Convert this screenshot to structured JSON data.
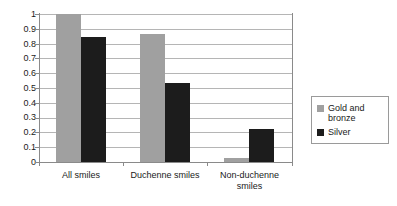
{
  "chart_data": {
    "type": "bar",
    "title": "",
    "xlabel": "",
    "ylabel": "",
    "categories": [
      "All smiles",
      "Duchenne smiles",
      "Non-duchenne smiles"
    ],
    "series": [
      {
        "name": "Gold and bronze",
        "color": "#a0a0a0",
        "values": [
          1.0,
          0.865,
          0.025
        ]
      },
      {
        "name": "Silver",
        "color": "#1c1c1c",
        "values": [
          0.845,
          0.535,
          0.225
        ]
      }
    ],
    "ylim": [
      0,
      1
    ],
    "ytick_labels": [
      "1",
      "0.9",
      "0.8",
      "0.7",
      "0.6",
      "0.5",
      "0.4",
      "0.3",
      "0.2",
      "0.1",
      "0"
    ],
    "ytick_values": [
      1,
      0.9,
      0.8,
      0.7,
      0.6,
      0.5,
      0.4,
      0.3,
      0.2,
      0.1,
      0
    ],
    "grid": "horizontal",
    "legend_position": "right",
    "legend_entries": [
      "Gold and bronze",
      "Silver"
    ]
  },
  "category_labels": [
    {
      "line1": "All smiles",
      "line2": ""
    },
    {
      "line1": "Duchenne smiles",
      "line2": ""
    },
    {
      "line1": "Non-duchenne",
      "line2": "smiles"
    }
  ],
  "legend": {
    "entries": [
      {
        "label_line1": "Gold and",
        "label_line2": "bronze",
        "swatch": "gold-swatch"
      },
      {
        "label_line1": "Silver",
        "label_line2": "",
        "swatch": "silver-swatch"
      }
    ]
  }
}
